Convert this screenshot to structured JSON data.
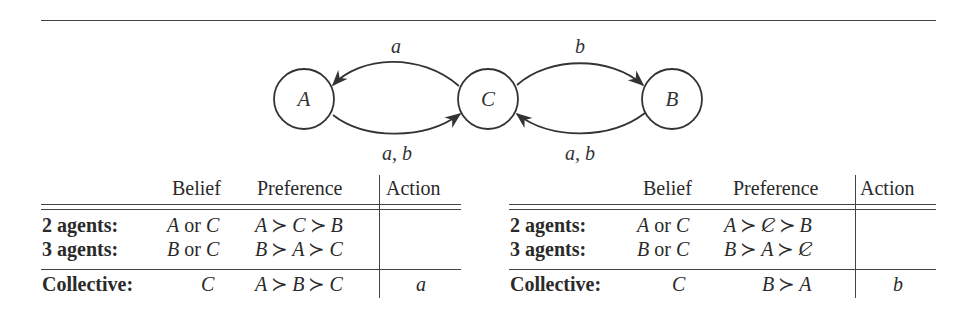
{
  "diagram": {
    "nodes": [
      {
        "id": "A",
        "label": "A",
        "cx": 304,
        "cy": 99
      },
      {
        "id": "C",
        "label": "C",
        "cx": 488,
        "cy": 99
      },
      {
        "id": "B",
        "label": "B",
        "cx": 672,
        "cy": 99
      }
    ],
    "edges": [
      {
        "from": "C",
        "to": "A",
        "label": "a"
      },
      {
        "from": "A",
        "to": "C",
        "label": "a, b"
      },
      {
        "from": "C",
        "to": "B",
        "label": "b"
      },
      {
        "from": "B",
        "to": "C",
        "label": "a, b"
      }
    ],
    "labels": {
      "ca": "a",
      "ac": "a, b",
      "cb": "b",
      "bc": "a, b"
    }
  },
  "tables": [
    {
      "headers": {
        "belief": "Belief",
        "preference": "Preference",
        "action": "Action"
      },
      "rows": [
        {
          "agent": "2 agents:",
          "belief": [
            "A",
            "or",
            "C"
          ],
          "preference": [
            "A",
            "C",
            "B"
          ],
          "cancelled": [],
          "action": ""
        },
        {
          "agent": "3 agents:",
          "belief": [
            "B",
            "or",
            "C"
          ],
          "preference": [
            "B",
            "A",
            "C"
          ],
          "cancelled": [],
          "action": ""
        },
        {
          "agent": "Collective:",
          "belief": [
            "C"
          ],
          "preference": [
            "A",
            "B",
            "C"
          ],
          "cancelled": [],
          "action": "a"
        }
      ]
    },
    {
      "headers": {
        "belief": "Belief",
        "preference": "Preference",
        "action": "Action"
      },
      "rows": [
        {
          "agent": "2 agents:",
          "belief": [
            "A",
            "or",
            "C"
          ],
          "preference": [
            "A",
            "C",
            "B"
          ],
          "cancelled": [
            "C"
          ],
          "action": ""
        },
        {
          "agent": "3 agents:",
          "belief": [
            "B",
            "or",
            "C"
          ],
          "preference": [
            "B",
            "A",
            "C"
          ],
          "cancelled": [
            "C"
          ],
          "action": ""
        },
        {
          "agent": "Collective:",
          "belief": [
            "C"
          ],
          "preference": [
            "B",
            "A"
          ],
          "cancelled": [],
          "action": "b"
        }
      ]
    }
  ],
  "symbols": {
    "succ": "≻"
  }
}
